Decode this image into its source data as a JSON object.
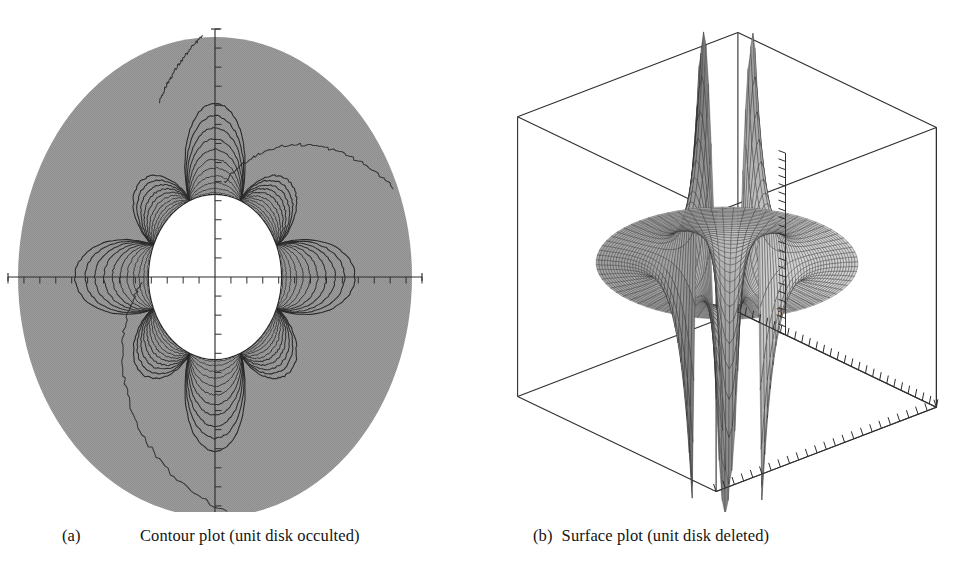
{
  "figure": {
    "panel_count": 2,
    "background_color": "#ffffff",
    "ink_color": "#2a2a2a",
    "fill_gray": "#9a9a9a"
  },
  "captions": [
    {
      "label": "(a)",
      "text": "Contour plot (unit disk occulted)"
    },
    {
      "label": "(b)",
      "text": "Surface plot (unit disk deleted)"
    }
  ],
  "chart_data": [
    {
      "type": "contour",
      "panel": "a",
      "title": "Contour plot (unit disk occulted)",
      "title_label": "(a)",
      "xlabel": "",
      "ylabel": "",
      "grid": false,
      "legend": false,
      "axes": {
        "style": "crossed-axes-through-origin",
        "x_axis": {
          "visible": true,
          "tick_count": 26,
          "tick_direction": "down",
          "end_caps": true
        },
        "y_axis": {
          "visible": true,
          "tick_count": 26,
          "tick_direction": "right",
          "end_caps": true
        }
      },
      "domain": {
        "shape": "disk",
        "outer_radius": 3.0,
        "inner_radius": 1.0,
        "inner_disk_state": "occulted",
        "inner_disk_fill": "#ffffff",
        "outer_fill": "#9a9a9a"
      },
      "contours": {
        "angular_lobes": 8,
        "lobe_symmetry": "4-fold mirrored",
        "levels_per_lobe": 11,
        "line_color": "#2a2a2a",
        "description": "nested petal-shaped level curves emanating from the unit circle"
      },
      "tick_labels": [],
      "xlim": [
        -3.0,
        3.0
      ],
      "ylim": [
        -3.0,
        3.0
      ]
    },
    {
      "type": "surface",
      "panel": "b",
      "title": "Surface plot (unit disk deleted)",
      "title_label": "(b)",
      "projection": "3d-perspective-wireframe-box",
      "grid": false,
      "legend": false,
      "domain": {
        "shape": "annulus",
        "outer_radius": 3.0,
        "inner_radius": 1.0,
        "inner_disk_state": "deleted"
      },
      "surface": {
        "mesh": "radial-annular",
        "radial_divisions": 34,
        "angular_divisions": 72,
        "shading": "gray-gradient",
        "spikes_up": 4,
        "spikes_down": 4,
        "spike_description": "tall narrow peaks and symmetric downward spikes at the poles of the function"
      },
      "axes": {
        "z_axis": {
          "visible": true,
          "tick_count": 22,
          "position": "front-center"
        },
        "depth_axis_right": {
          "visible": true,
          "tick_count": 24
        },
        "depth_axis_front": {
          "visible": true,
          "tick_count": 28
        },
        "box_wireframe": true
      },
      "tick_labels": [
        {
          "text": "3",
          "axis": "z",
          "value": 3
        }
      ],
      "zlim": [
        -3,
        3
      ]
    }
  ]
}
